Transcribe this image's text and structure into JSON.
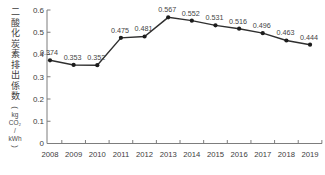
{
  "figure": {
    "y_axis_title": "二酸化炭素排出係数",
    "y_axis_unit_lines": [
      "(",
      "kg",
      "CO₂",
      "/",
      "kWh",
      ")"
    ]
  },
  "chart_data": {
    "type": "line",
    "title": "",
    "xlabel": "",
    "ylabel": "二酸化炭素排出係数（kg CO₂/kWh）",
    "categories": [
      "2008",
      "2009",
      "2010",
      "2011",
      "2012",
      "2013",
      "2014",
      "2015",
      "2016",
      "2017",
      "2018",
      "2019"
    ],
    "series": [
      {
        "name": "二酸化炭素排出係数",
        "values": [
          0.374,
          0.353,
          0.352,
          0.475,
          0.481,
          0.567,
          0.552,
          0.531,
          0.516,
          0.496,
          0.463,
          0.444
        ],
        "data_labels": [
          "0.374",
          "0.353",
          "0.352",
          "0.475",
          "0.481",
          "0.567",
          "0.552",
          "0.531",
          "0.516",
          "0.496",
          "0.463",
          "0.444"
        ]
      }
    ],
    "ylim": [
      0,
      0.6
    ],
    "ytick_labels": [
      "0",
      "0.1",
      "0.2",
      "0.3",
      "0.4",
      "0.5",
      "0.6"
    ],
    "grid": false,
    "legend": false,
    "marker": "dot",
    "colors": {
      "line": "#2f2f2f",
      "marker": "#1c1c1c",
      "axis": "#7d7d7d",
      "text": "#3d3d3d",
      "label": "#444444"
    }
  }
}
